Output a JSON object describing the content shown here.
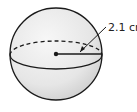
{
  "diagram": {
    "shape": "sphere",
    "radius_label": "2.1 cm",
    "radius_value": 2.1,
    "radius_unit": "cm",
    "colors": {
      "fill_light": "#f2f2f2",
      "fill_shade": "#d9d9d9",
      "stroke": "#1a1a1a"
    }
  }
}
